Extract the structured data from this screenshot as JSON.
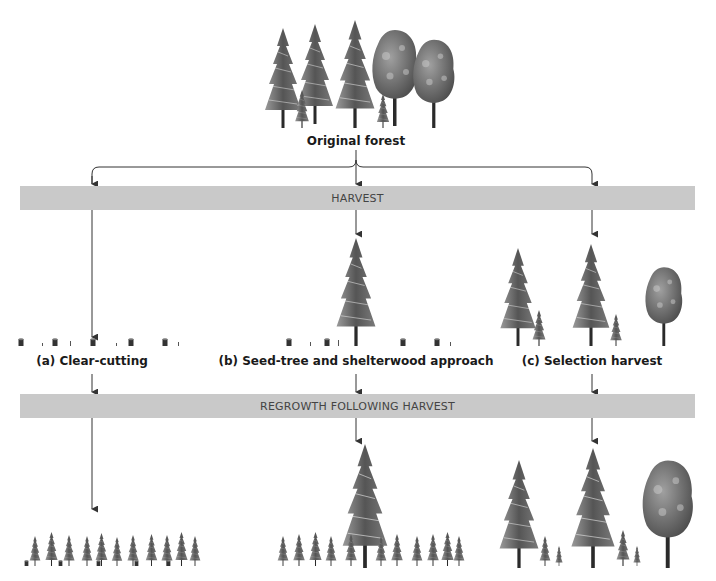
{
  "diagram": {
    "top": {
      "label": "Original forest"
    },
    "bars": {
      "harvest": "HARVEST",
      "regrowth": "REGROWTH FOLLOWING HARVEST"
    },
    "methods": [
      {
        "id": "a",
        "label": "(a) Clear-cutting"
      },
      {
        "id": "b",
        "label": "(b) Seed-tree and shelterwood approach"
      },
      {
        "id": "c",
        "label": "(c) Selection harvest"
      }
    ],
    "icons": {
      "conifer": "conifer-tree-icon",
      "deciduous": "deciduous-tree-icon",
      "stump": "tree-stump-icon",
      "arrow": "arrow-down-icon"
    },
    "colors": {
      "bar": "#c9c9c9",
      "line": "#333333",
      "tree_dark": "#3a3a3a",
      "tree_light": "#8a8a8a"
    }
  }
}
